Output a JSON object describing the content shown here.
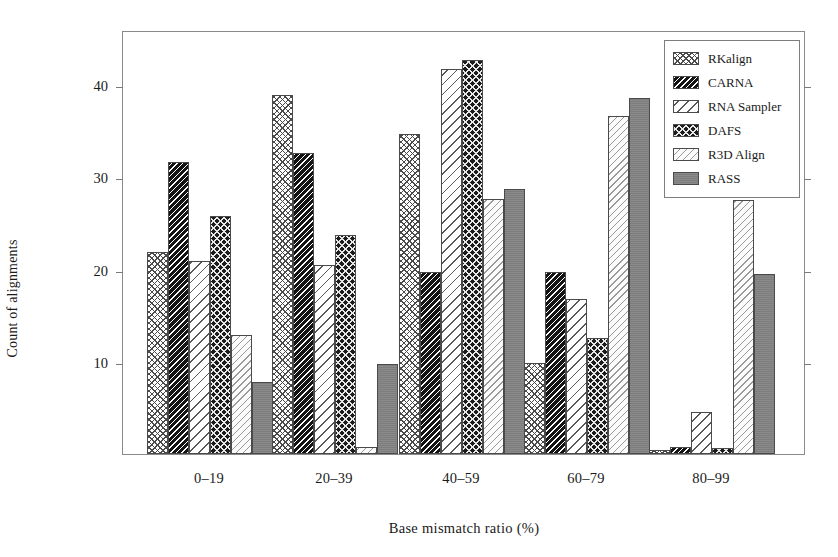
{
  "chart_data": {
    "type": "bar",
    "title": "",
    "xlabel": "Base  mismatch ratio (%)",
    "ylabel": "Count of alignments",
    "categories": [
      "0–19",
      "20–39",
      "40–59",
      "60–79",
      "80–99"
    ],
    "yticks": [
      10,
      20,
      30,
      40
    ],
    "ylim": [
      0,
      46
    ],
    "grid": false,
    "legend_position": "top-right",
    "series": [
      {
        "name": "RKalign",
        "pattern": "cross-hatch-light",
        "values": [
          21.9,
          38.9,
          34.7,
          9.9,
          0.4
        ]
      },
      {
        "name": "CARNA",
        "pattern": "diagonal-dark",
        "values": [
          31.7,
          32.7,
          19.8,
          19.8,
          0.8
        ]
      },
      {
        "name": "RNA Sampler",
        "pattern": "diagonal-wide",
        "values": [
          20.9,
          20.5,
          41.8,
          16.8,
          4.6
        ]
      },
      {
        "name": "DAFS",
        "pattern": "net-dark",
        "values": [
          25.8,
          23.8,
          42.8,
          12.6,
          0.7
        ]
      },
      {
        "name": "R3D Align",
        "pattern": "diagonal-fine-pale",
        "values": [
          12.9,
          0.8,
          27.7,
          36.7,
          27.6
        ]
      },
      {
        "name": "RASS",
        "pattern": "solid-grey",
        "values": [
          7.8,
          9.8,
          28.7,
          38.6,
          19.5
        ]
      }
    ]
  },
  "legend": {
    "items": [
      {
        "label": "RKalign"
      },
      {
        "label": "CARNA"
      },
      {
        "label": "RNA Sampler"
      },
      {
        "label": "DAFS"
      },
      {
        "label": "R3D Align"
      },
      {
        "label": "RASS"
      }
    ]
  }
}
